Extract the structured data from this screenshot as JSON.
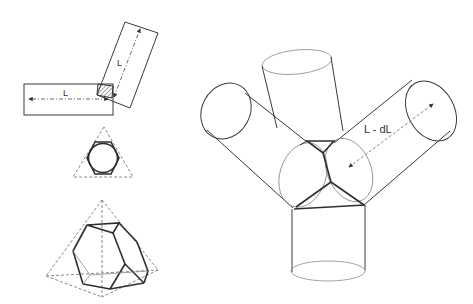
{
  "figure": {
    "panel_left_top": {
      "description": "two rectangular struts of length L joined at a hatched square node",
      "horizontal_strut_label": "L",
      "inclined_strut_label": "L"
    },
    "panel_left_middle": {
      "description": "circle inscribed in hexagon inside dashed triangle"
    },
    "panel_left_bottom": {
      "description": "truncated tetrahedron inside dashed tetrahedron"
    },
    "panel_right": {
      "description": "four cylindrical struts meeting at a truncated-tetrahedral node",
      "dimension_label": "L - dL"
    }
  }
}
